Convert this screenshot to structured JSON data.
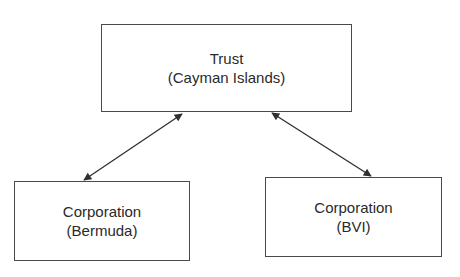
{
  "nodes": [
    {
      "id": "trust",
      "title": "Trust",
      "subtitle": "(Cayman Islands)"
    },
    {
      "id": "bermuda",
      "title": "Corporation",
      "subtitle": "(Bermuda)"
    },
    {
      "id": "bvi",
      "title": "Corporation",
      "subtitle": "(BVI)"
    }
  ],
  "edges": [
    {
      "from": "trust",
      "to": "bermuda",
      "direction": "bidirectional"
    },
    {
      "from": "trust",
      "to": "bvi",
      "direction": "bidirectional"
    }
  ],
  "colors": {
    "line": "#2f2f2f",
    "border": "#4a4a4a",
    "text": "#2a2a2a",
    "background": "#ffffff"
  }
}
